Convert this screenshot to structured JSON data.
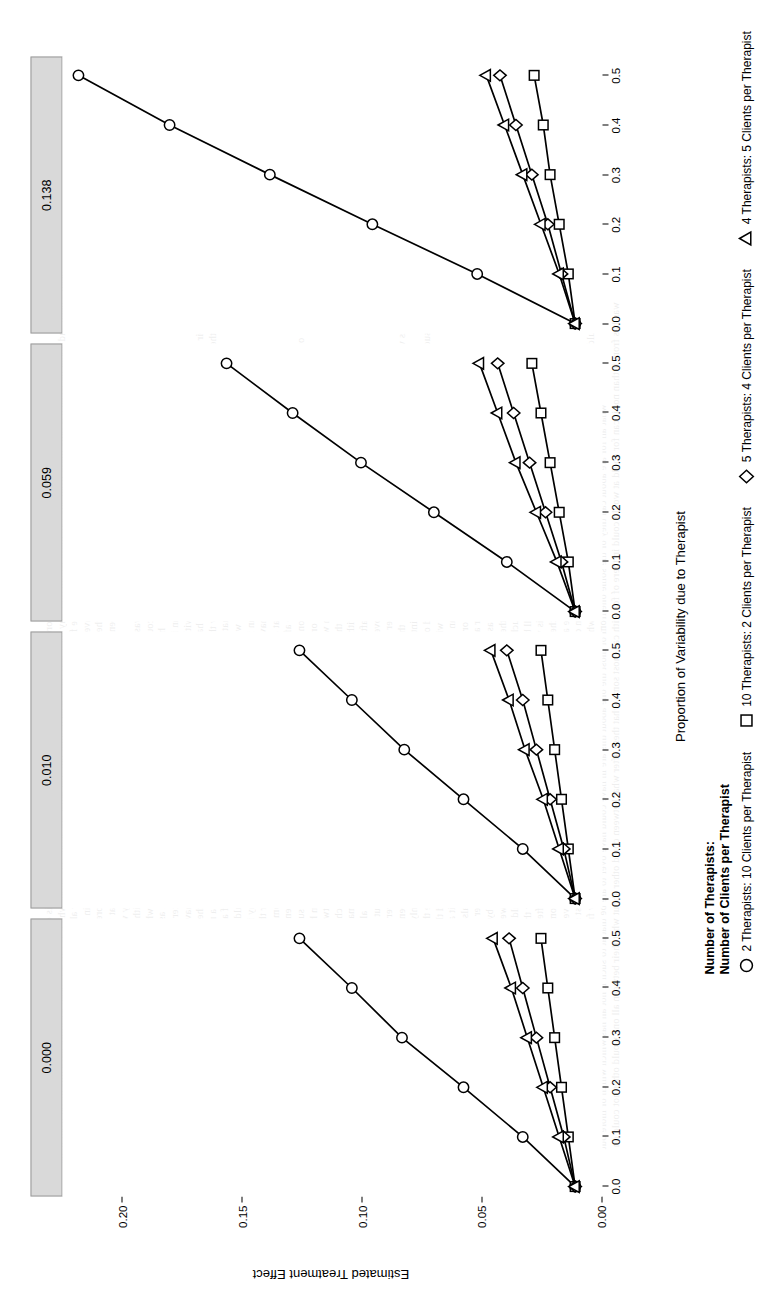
{
  "chart_data": {
    "type": "line",
    "title": "",
    "xlabel": "Proportion of Variability due to Therapist",
    "ylabel": "Estimated Treatment Effect",
    "xlim": [
      -0.02,
      0.54
    ],
    "ylim": [
      -0.012,
      0.225
    ],
    "xticks": [
      "0.0",
      "0.1",
      "0.2",
      "0.3",
      "0.4",
      "0.5"
    ],
    "xtickvals": [
      0.0,
      0.1,
      0.2,
      0.3,
      0.4,
      0.5
    ],
    "yticks": [
      "0.00",
      "0.05",
      "0.10",
      "0.15",
      "0.20"
    ],
    "ytickvals": [
      0.0,
      0.05,
      0.1,
      0.15,
      0.2
    ],
    "grid": false,
    "legend_position": "bottom",
    "panel_variable": "Intraclass Correlation",
    "panels": [
      {
        "label": "0.000",
        "series": [
          {
            "name": "2 Therapists: 10 Clients per Therapist",
            "symbol": "circle",
            "x": [
              0.0,
              0.1,
              0.2,
              0.3,
              0.4,
              0.5
            ],
            "y": [
              0.0,
              0.023,
              0.049,
              0.076,
              0.098,
              0.121
            ]
          },
          {
            "name": "10 Therapists: 2 Clients per Therapist",
            "symbol": "square",
            "x": [
              0.0,
              0.1,
              0.2,
              0.3,
              0.4,
              0.5
            ],
            "y": [
              0.0,
              0.003,
              0.006,
              0.009,
              0.012,
              0.015
            ]
          },
          {
            "name": "5 Therapists: 4 Clients per Therapist",
            "symbol": "diamond",
            "x": [
              0.0,
              0.1,
              0.2,
              0.3,
              0.4,
              0.5
            ],
            "y": [
              0.0,
              0.005,
              0.011,
              0.017,
              0.023,
              0.029
            ]
          },
          {
            "name": "4 Therapists: 5 Clients per Therapist",
            "symbol": "triangle",
            "x": [
              0.0,
              0.1,
              0.2,
              0.3,
              0.4,
              0.5
            ],
            "y": [
              0.0,
              0.007,
              0.014,
              0.021,
              0.028,
              0.036
            ]
          }
        ]
      },
      {
        "label": "0.010",
        "series": [
          {
            "name": "2 Therapists: 10 Clients per Therapist",
            "symbol": "circle",
            "x": [
              0.0,
              0.1,
              0.2,
              0.3,
              0.4,
              0.5
            ],
            "y": [
              0.0,
              0.023,
              0.049,
              0.075,
              0.098,
              0.121
            ]
          },
          {
            "name": "10 Therapists: 2 Clients per Therapist",
            "symbol": "square",
            "x": [
              0.0,
              0.1,
              0.2,
              0.3,
              0.4,
              0.5
            ],
            "y": [
              0.0,
              0.003,
              0.006,
              0.009,
              0.012,
              0.015
            ]
          },
          {
            "name": "5 Therapists: 4 Clients per Therapist",
            "symbol": "diamond",
            "x": [
              0.0,
              0.1,
              0.2,
              0.3,
              0.4,
              0.5
            ],
            "y": [
              0.0,
              0.005,
              0.011,
              0.017,
              0.023,
              0.03
            ]
          },
          {
            "name": "4 Therapists: 5 Clients per Therapist",
            "symbol": "triangle",
            "x": [
              0.0,
              0.1,
              0.2,
              0.3,
              0.4,
              0.5
            ],
            "y": [
              0.0,
              0.007,
              0.014,
              0.022,
              0.029,
              0.037
            ]
          }
        ]
      },
      {
        "label": "0.059",
        "series": [
          {
            "name": "2 Therapists: 10 Clients per Therapist",
            "symbol": "circle",
            "x": [
              0.0,
              0.1,
              0.2,
              0.3,
              0.4,
              0.5
            ],
            "y": [
              0.0,
              0.03,
              0.062,
              0.094,
              0.124,
              0.153
            ]
          },
          {
            "name": "10 Therapists: 2 Clients per Therapist",
            "symbol": "square",
            "x": [
              0.0,
              0.1,
              0.2,
              0.3,
              0.4,
              0.5
            ],
            "y": [
              0.0,
              0.003,
              0.007,
              0.011,
              0.015,
              0.019
            ]
          },
          {
            "name": "5 Therapists: 4 Clients per Therapist",
            "symbol": "diamond",
            "x": [
              0.0,
              0.1,
              0.2,
              0.3,
              0.4,
              0.5
            ],
            "y": [
              0.0,
              0.006,
              0.013,
              0.02,
              0.027,
              0.034
            ]
          },
          {
            "name": "4 Therapists: 5 Clients per Therapist",
            "symbol": "triangle",
            "x": [
              0.0,
              0.1,
              0.2,
              0.3,
              0.4,
              0.5
            ],
            "y": [
              0.0,
              0.008,
              0.017,
              0.026,
              0.034,
              0.042
            ]
          }
        ]
      },
      {
        "label": "0.138",
        "series": [
          {
            "name": "2 Therapists: 10 Clients per Therapist",
            "symbol": "circle",
            "x": [
              0.0,
              0.1,
              0.2,
              0.3,
              0.4,
              0.5
            ],
            "y": [
              0.0,
              0.043,
              0.089,
              0.134,
              0.178,
              0.218
            ]
          },
          {
            "name": "10 Therapists: 2 Clients per Therapist",
            "symbol": "square",
            "x": [
              0.0,
              0.1,
              0.2,
              0.3,
              0.4,
              0.5
            ],
            "y": [
              0.0,
              0.003,
              0.007,
              0.011,
              0.014,
              0.018
            ]
          },
          {
            "name": "5 Therapists: 4 Clients per Therapist",
            "symbol": "diamond",
            "x": [
              0.0,
              0.1,
              0.2,
              0.3,
              0.4,
              0.5
            ],
            "y": [
              0.0,
              0.006,
              0.012,
              0.019,
              0.026,
              0.033
            ]
          },
          {
            "name": "4 Therapists: 5 Clients per Therapist",
            "symbol": "triangle",
            "x": [
              0.0,
              0.1,
              0.2,
              0.3,
              0.4,
              0.5
            ],
            "y": [
              0.0,
              0.007,
              0.015,
              0.023,
              0.031,
              0.039
            ]
          }
        ]
      }
    ]
  },
  "legend": {
    "title_line1": "Number of Therapists:",
    "title_line2": "Number of Clients per Therapist",
    "entries": [
      {
        "symbol": "circle",
        "label": "2 Therapists: 10 Clients per Therapist"
      },
      {
        "symbol": "square",
        "label": "10 Therapists: 2 Clients per Therapist"
      },
      {
        "symbol": "diamond",
        "label": "5 Therapists: 4 Clients per Therapist"
      },
      {
        "symbol": "triangle",
        "label": "4 Therapists: 5 Clients per Therapist"
      }
    ]
  },
  "axes": {
    "x_title": "Proportion of Variability due to Therapist",
    "y_title": "Estimated Treatment Effect"
  },
  "colors": {
    "line": "#000000",
    "marker_fill": "#ffffff",
    "strip_background": "#d9d9d9",
    "strip_border": "#9a9a9a",
    "text": "#000000"
  }
}
